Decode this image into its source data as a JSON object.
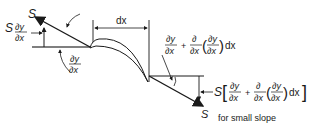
{
  "diagram": {
    "left_force": {
      "label": "S",
      "vertical_component": {
        "prefix": "S",
        "num": "∂y",
        "den": "∂x"
      },
      "angle": {
        "num": "∂y",
        "den": "∂x"
      }
    },
    "segment_width": {
      "label": "dx"
    },
    "right_force": {
      "label": "S",
      "angle": {
        "t1_num": "∂y",
        "t1_den": "∂x",
        "plus": "+",
        "t2_num": "∂",
        "t2_den": "∂x",
        "inner_num": "∂y",
        "inner_den": "∂x",
        "dx": "dx"
      },
      "vertical_component": {
        "prefix": "S",
        "t1_num": "∂y",
        "t1_den": "∂x",
        "plus": "+",
        "t2_num": "∂",
        "t2_den": "∂x",
        "inner_num": "∂y",
        "inner_den": "∂x",
        "dx": "dx"
      },
      "note": "for small slope"
    }
  }
}
